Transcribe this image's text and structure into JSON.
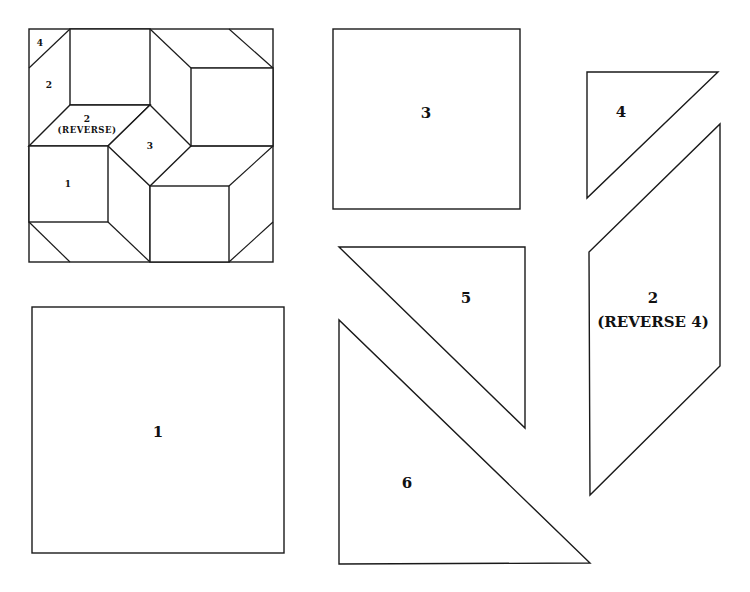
{
  "diagram": {
    "block": {
      "name": "Quilt block assembly",
      "labels": {
        "piece_4": "4",
        "piece_2": "2",
        "piece_2_reverse_num": "2",
        "piece_2_reverse_text": "(REVERSE)",
        "piece_3": "3",
        "piece_1": "1"
      }
    },
    "templates": [
      {
        "id": "template-1",
        "label": "1",
        "shape": "square"
      },
      {
        "id": "template-3",
        "label": "3",
        "shape": "square"
      },
      {
        "id": "template-4",
        "label": "4",
        "shape": "right-triangle"
      },
      {
        "id": "template-2",
        "label": "2",
        "sublabel": "(REVERSE 4)",
        "shape": "parallelogram"
      },
      {
        "id": "template-5",
        "label": "5",
        "shape": "right-triangle"
      },
      {
        "id": "template-6",
        "label": "6",
        "shape": "right-triangle"
      }
    ]
  }
}
